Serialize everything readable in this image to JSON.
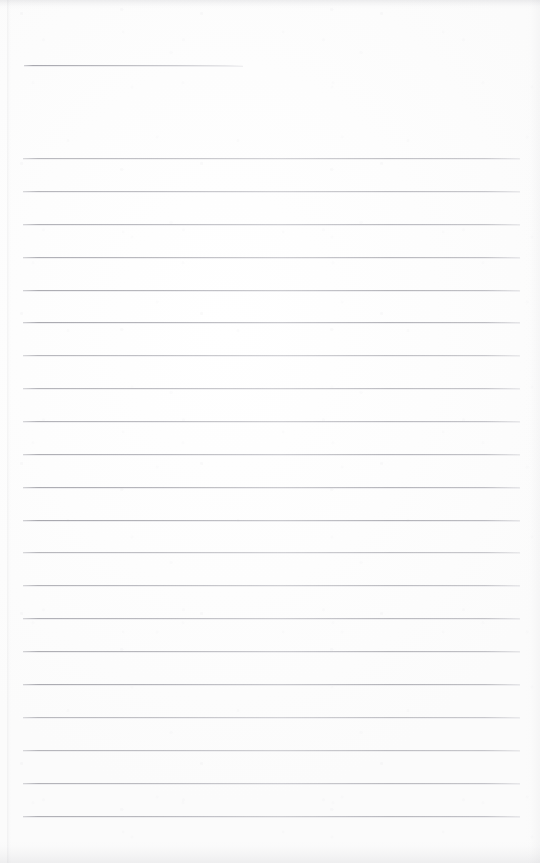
{
  "document": {
    "kind": "scanned-blank-ruled-notepad-page",
    "page_width": 540,
    "page_height": 863,
    "background_color": "#fdfdfd",
    "rule_color": "#aeaeb5",
    "has_text": false,
    "text_content": "",
    "note": ""
  },
  "rules": {
    "header_rule": {
      "label": "",
      "x": 24,
      "y": 65,
      "width": 219,
      "thickness": 1
    },
    "body_rules": {
      "count": 21,
      "x": 23,
      "width": 497,
      "first_y": 158,
      "spacing": 32.9,
      "thickness": 1,
      "y_positions": [
        158,
        191,
        224,
        257,
        290,
        322,
        355,
        388,
        421,
        454,
        487,
        520,
        552,
        585,
        618,
        651,
        684,
        717,
        750,
        783,
        816
      ]
    }
  },
  "edges": {
    "top_shadow": true,
    "bottom_shadow": true,
    "left_edge_x": 8,
    "right_edge_tone": true
  }
}
